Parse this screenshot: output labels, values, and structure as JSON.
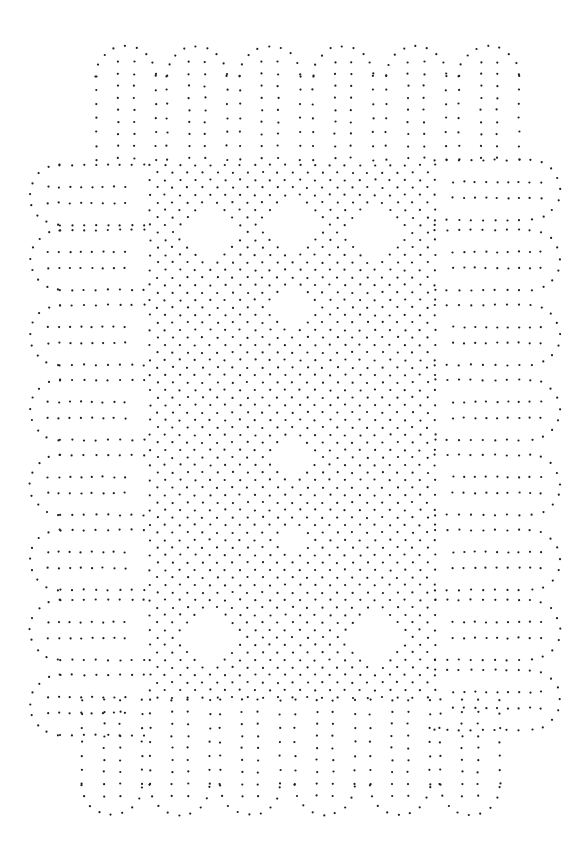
{
  "image": {
    "width": 585,
    "height": 857,
    "background": "#ffffff",
    "dot_color": "#1e1e1e",
    "dot_radius": 1.1,
    "description": "Bobbin lace pricking: border of rounded tape lobes with diamond ground and open diamonds"
  },
  "pattern": {
    "top_lobes": {
      "centers_x": [
        126,
        197,
        270,
        343,
        416,
        489
      ],
      "top_y": 46,
      "bottom_y": 165,
      "half_width": 30,
      "inner_col_offset": 8
    },
    "bottom_lobes": {
      "centers_x": [
        112,
        180,
        250,
        325,
        400,
        470
      ],
      "top_y": 700,
      "bottom_y": 815,
      "half_width": 30,
      "inner_col_offset": 8
    },
    "left_lobes": {
      "centers_y": [
        195,
        260,
        335,
        410,
        485,
        560,
        630,
        705
      ],
      "left_x": 30,
      "right_x": 150,
      "half_height": 30,
      "inner_row_offset": 8
    },
    "right_lobes": {
      "centers_y": [
        190,
        260,
        335,
        410,
        485,
        560,
        630,
        700
      ],
      "left_x": 435,
      "right_x": 560,
      "half_height": 30,
      "inner_row_offset": 8
    },
    "ground": {
      "x_min": 150,
      "x_max": 440,
      "y_min": 165,
      "y_max": 700,
      "spacing": 15,
      "holes": [
        {
          "cx": 210,
          "cy": 230,
          "r": 32
        },
        {
          "cx": 292,
          "cy": 230,
          "r": 32
        },
        {
          "cx": 375,
          "cy": 230,
          "r": 32
        },
        {
          "cx": 292,
          "cy": 310,
          "r": 24
        },
        {
          "cx": 292,
          "cy": 460,
          "r": 22
        },
        {
          "cx": 292,
          "cy": 540,
          "r": 22
        },
        {
          "cx": 210,
          "cy": 640,
          "r": 30
        },
        {
          "cx": 375,
          "cy": 640,
          "r": 30
        }
      ]
    }
  }
}
